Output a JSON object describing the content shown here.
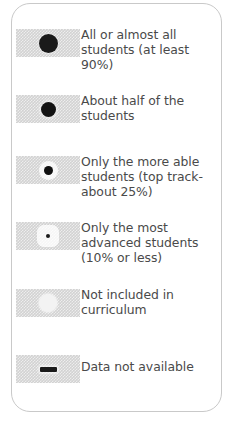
{
  "legend": {
    "frame": {
      "border_color": "#c9c9c9",
      "background": "#ffffff"
    },
    "swatch_background": "#d2d2d2",
    "text_color": "#4a4a4a",
    "items": [
      {
        "symbol": "large-filled-circle",
        "symbol_class": "sym-all",
        "label": "All or almost all\nstudents (at least\n90%)",
        "swatch_top": 25,
        "label_top": 23
      },
      {
        "symbol": "medium-filled-circle",
        "symbol_class": "sym-half",
        "label": "About half of the\nstudents",
        "swatch_top": 91,
        "label_top": 89
      },
      {
        "symbol": "small-dot-circle",
        "symbol_class": "sym-able",
        "label": "Only the more able\nstudents (top track-\nabout 25%)",
        "swatch_top": 152,
        "label_top": 150
      },
      {
        "symbol": "tiny-dot-circle",
        "symbol_class": "sym-advanced",
        "label": "Only the most\nadvanced students\n(10% or less)",
        "swatch_top": 218,
        "label_top": 216
      },
      {
        "symbol": "open-white-circle",
        "symbol_class": "sym-notincluded",
        "label": "Not included in\ncurriculum",
        "swatch_top": 285,
        "label_top": 283
      },
      {
        "symbol": "horizontal-dash",
        "symbol_class": "sym-nodata",
        "label": "Data not available",
        "swatch_top": 351,
        "label_top": 355
      }
    ]
  }
}
